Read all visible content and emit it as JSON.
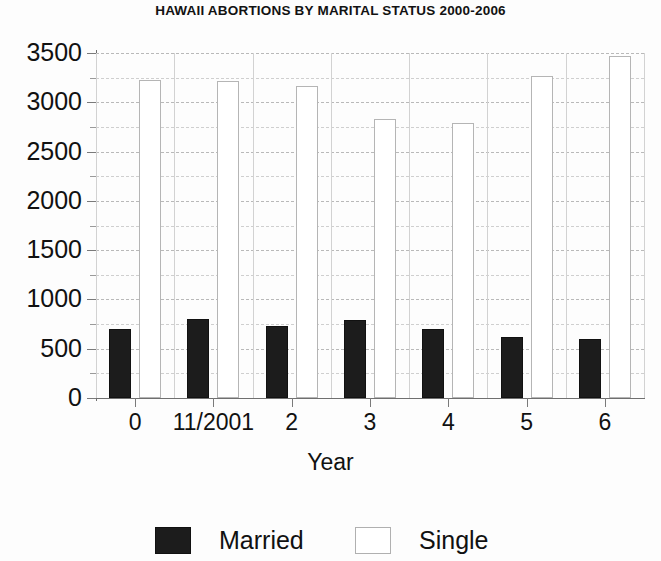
{
  "chart_data": {
    "type": "bar",
    "title": "HAWAII ABORTIONS BY MARITAL STATUS 2000-2006",
    "xlabel": "Year",
    "ylabel": "",
    "categories": [
      "0",
      "11/2001",
      "2",
      "3",
      "4",
      "5",
      "6"
    ],
    "series": [
      {
        "name": "Married",
        "color": "#1c1c1c",
        "values": [
          700,
          800,
          735,
          795,
          700,
          620,
          595
        ]
      },
      {
        "name": "Single",
        "color": "#ffffff",
        "values": [
          3230,
          3215,
          3170,
          2830,
          2790,
          3265,
          3465
        ]
      }
    ],
    "ylim": [
      0,
      3500
    ],
    "ytick_labels": [
      "0",
      "500",
      "1000",
      "1500",
      "2000",
      "2500",
      "3000",
      "3500"
    ],
    "ytick_values": [
      0,
      500,
      1000,
      1500,
      2000,
      2500,
      3000,
      3500
    ],
    "yminor_values": [
      250,
      750,
      1250,
      1750,
      2250,
      2750,
      3250
    ],
    "grid": true,
    "legend_position": "bottom"
  },
  "legend": {
    "married_label": "Married",
    "single_label": "Single"
  }
}
